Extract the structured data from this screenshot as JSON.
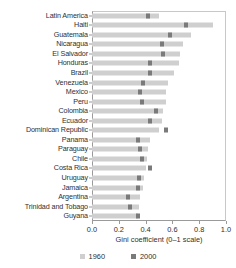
{
  "chart_data": {
    "type": "bar",
    "title": "",
    "xlabel": "Gini coefficient (0–1 scale)",
    "ylabel": "",
    "xlim": [
      0,
      1
    ],
    "xticks": [
      "0.0",
      "0.2",
      "0.4",
      "0.6",
      "0.8",
      "1.0"
    ],
    "xtick_values": [
      0.0,
      0.2,
      0.4,
      0.6,
      0.8,
      1.0
    ],
    "grid": false,
    "legend_position": "bottom",
    "colors": {
      "series_1960": "#cfcfcf",
      "series_2000": "#7a7a7a",
      "axis": "#9a9a9a",
      "text": "#2f2f2f",
      "background": "#ffffff"
    },
    "categories": [
      "Latin America",
      "Haiti",
      "Guatemala",
      "Nicaragua",
      "El Salvador",
      "Honduras",
      "Brazil",
      "Venezuela",
      "Mexico",
      "Peru",
      "Colombia",
      "Ecuador",
      "Dominican Republic",
      "Panama",
      "Paraguay",
      "Chile",
      "Costa Rica",
      "Uruguay",
      "Jamaica",
      "Argentina",
      "Trinidad and Tobago",
      "Guyana"
    ],
    "series": [
      {
        "name": "1960",
        "color": "#cfcfcf",
        "values": [
          0.5,
          0.9,
          0.74,
          0.68,
          0.66,
          0.65,
          0.61,
          0.57,
          0.55,
          0.55,
          0.53,
          0.52,
          0.5,
          0.43,
          0.42,
          0.41,
          0.4,
          0.39,
          0.38,
          0.36,
          0.35,
          0.34
        ]
      },
      {
        "name": "2000",
        "color": "#7a7a7a",
        "values": [
          0.42,
          0.7,
          0.58,
          0.52,
          0.53,
          0.43,
          0.43,
          0.38,
          0.36,
          0.37,
          0.48,
          0.43,
          0.55,
          0.34,
          0.36,
          0.37,
          0.43,
          0.35,
          0.34,
          0.27,
          0.28,
          0.34
        ]
      }
    ]
  },
  "legend": {
    "items": [
      {
        "label": "1960",
        "swatch_class": "s1960"
      },
      {
        "label": "2000",
        "swatch_class": "s2000"
      }
    ]
  }
}
